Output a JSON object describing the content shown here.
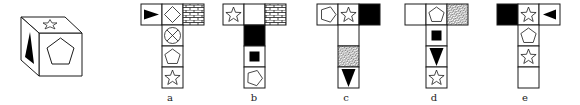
{
  "cube": {
    "faces": {
      "top": "star-outline",
      "front": "pentagon-outline",
      "left": "black-triangle-vertical"
    }
  },
  "options": [
    {
      "label": "a",
      "x": 141,
      "y": 4,
      "cell": 21,
      "cells": [
        {
          "col": 0,
          "row": 0,
          "symbol": "black-triangle-right"
        },
        {
          "col": 1,
          "row": 0,
          "symbol": "diamond-outline"
        },
        {
          "col": 2,
          "row": 0,
          "symbol": "brick-pattern"
        },
        {
          "col": 1,
          "row": 1,
          "symbol": "circle-cross"
        },
        {
          "col": 1,
          "row": 2,
          "symbol": "pentagon-outline"
        },
        {
          "col": 1,
          "row": 3,
          "symbol": "star-outline"
        }
      ]
    },
    {
      "label": "b",
      "x": 223,
      "y": 4,
      "cell": 21,
      "cells": [
        {
          "col": 0,
          "row": 0,
          "symbol": "star-outline"
        },
        {
          "col": 1,
          "row": 0,
          "symbol": "blank"
        },
        {
          "col": 2,
          "row": 0,
          "symbol": "brick-pattern"
        },
        {
          "col": 1,
          "row": 1,
          "symbol": "solid-black"
        },
        {
          "col": 1,
          "row": 2,
          "symbol": "black-square"
        },
        {
          "col": 1,
          "row": 3,
          "symbol": "pentagon-tilted"
        }
      ]
    },
    {
      "label": "c",
      "x": 317,
      "y": 4,
      "cell": 21,
      "cells": [
        {
          "col": 0,
          "row": 0,
          "symbol": "pentagon-sideways"
        },
        {
          "col": 1,
          "row": 0,
          "symbol": "star-outline"
        },
        {
          "col": 2,
          "row": 0,
          "symbol": "solid-black"
        },
        {
          "col": 1,
          "row": 1,
          "symbol": "blank"
        },
        {
          "col": 1,
          "row": 2,
          "symbol": "hatch-pattern"
        },
        {
          "col": 1,
          "row": 3,
          "symbol": "black-triangle-down"
        }
      ]
    },
    {
      "label": "d",
      "x": 405,
      "y": 4,
      "cell": 21,
      "cells": [
        {
          "col": 0,
          "row": 0,
          "symbol": "blank"
        },
        {
          "col": 1,
          "row": 0,
          "symbol": "pentagon-outline"
        },
        {
          "col": 2,
          "row": 0,
          "symbol": "hatch-pattern"
        },
        {
          "col": 1,
          "row": 1,
          "symbol": "black-square"
        },
        {
          "col": 1,
          "row": 2,
          "symbol": "black-triangle-down"
        },
        {
          "col": 1,
          "row": 3,
          "symbol": "star-outline"
        }
      ]
    },
    {
      "label": "e",
      "x": 497,
      "y": 4,
      "cell": 21,
      "cells": [
        {
          "col": 0,
          "row": 0,
          "symbol": "solid-black"
        },
        {
          "col": 1,
          "row": 0,
          "symbol": "star-outline"
        },
        {
          "col": 2,
          "row": 0,
          "symbol": "black-triangle-left"
        },
        {
          "col": 1,
          "row": 1,
          "symbol": "pentagon-outline"
        },
        {
          "col": 1,
          "row": 2,
          "symbol": "star-outline"
        },
        {
          "col": 1,
          "row": 3,
          "symbol": "blank"
        }
      ]
    }
  ],
  "colors": {
    "ink": "#1a1a1a",
    "paper": "#ffffff"
  }
}
